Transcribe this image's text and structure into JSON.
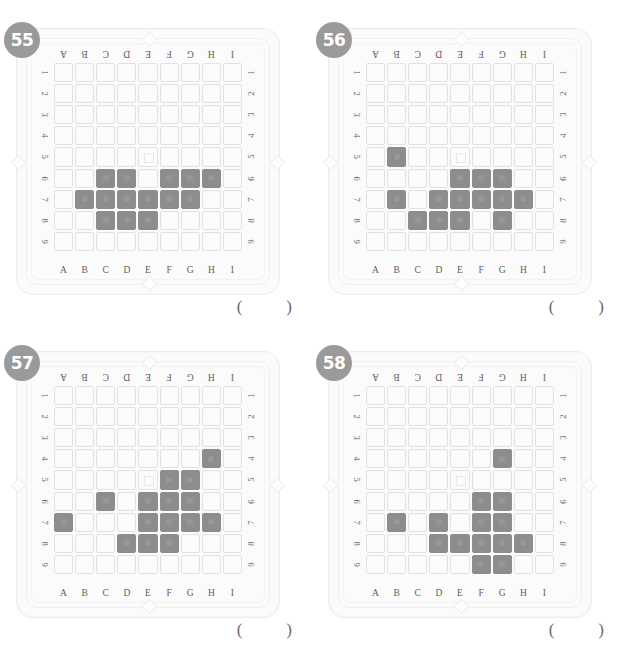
{
  "page": {
    "column_labels": [
      "A",
      "B",
      "C",
      "D",
      "E",
      "F",
      "G",
      "H",
      "I"
    ],
    "row_labels": [
      "1",
      "2",
      "3",
      "4",
      "5",
      "6",
      "7",
      "8",
      "9"
    ],
    "answer_open": "(",
    "answer_close": ")",
    "colors": {
      "badge_background": "#9a9a9a",
      "badge_text": "#ffffff",
      "well_empty": "#fcfcfc",
      "well_filled": "#8d8d8d",
      "well_border": "#e2e2e2",
      "plate_background": "#fbfbfb",
      "label_text": "#5d5d5d",
      "page_background": "#ffffff"
    },
    "mark_cell": "E5"
  },
  "panels": [
    {
      "number": "55",
      "grid_rows": 9,
      "grid_cols": 9,
      "filled_cells": [
        "C6",
        "D6",
        "F6",
        "G6",
        "H6",
        "B7",
        "C7",
        "D7",
        "E7",
        "F7",
        "G7",
        "C8",
        "D8",
        "E8"
      ],
      "filled_by_row": {
        "1": [],
        "2": [],
        "3": [],
        "4": [],
        "5": [],
        "6": [
          "C",
          "D",
          "F",
          "G",
          "H"
        ],
        "7": [
          "B",
          "C",
          "D",
          "E",
          "F",
          "G"
        ],
        "8": [
          "C",
          "D",
          "E"
        ],
        "9": []
      },
      "filled_count": 14
    },
    {
      "number": "56",
      "grid_rows": 9,
      "grid_cols": 9,
      "filled_cells": [
        "B5",
        "E6",
        "F6",
        "G6",
        "B7",
        "D7",
        "E7",
        "F7",
        "G7",
        "H7",
        "C8",
        "D8",
        "E8",
        "G8"
      ],
      "filled_by_row": {
        "1": [],
        "2": [],
        "3": [],
        "4": [],
        "5": [
          "B"
        ],
        "6": [
          "E",
          "F",
          "G"
        ],
        "7": [
          "B",
          "D",
          "E",
          "F",
          "G",
          "H"
        ],
        "8": [
          "C",
          "D",
          "E",
          "G"
        ],
        "9": []
      },
      "filled_count": 14
    },
    {
      "number": "57",
      "grid_rows": 9,
      "grid_cols": 9,
      "filled_cells": [
        "H4",
        "F5",
        "G5",
        "C6",
        "E6",
        "F6",
        "G6",
        "A7",
        "E7",
        "F7",
        "G7",
        "H7",
        "D8",
        "E8",
        "F8"
      ],
      "filled_by_row": {
        "1": [],
        "2": [],
        "3": [],
        "4": [
          "H"
        ],
        "5": [
          "F",
          "G"
        ],
        "6": [
          "C",
          "E",
          "F",
          "G"
        ],
        "7": [
          "A",
          "E",
          "F",
          "G",
          "H"
        ],
        "8": [
          "D",
          "E",
          "F"
        ],
        "9": []
      },
      "filled_count": 15
    },
    {
      "number": "58",
      "grid_rows": 9,
      "grid_cols": 9,
      "filled_cells": [
        "G4",
        "F6",
        "G6",
        "B7",
        "D7",
        "F7",
        "G7",
        "D8",
        "E8",
        "F8",
        "G8",
        "H8",
        "F9",
        "G9"
      ],
      "filled_by_row": {
        "1": [],
        "2": [],
        "3": [],
        "4": [
          "G"
        ],
        "5": [],
        "6": [
          "F",
          "G"
        ],
        "7": [
          "B",
          "D",
          "F",
          "G"
        ],
        "8": [
          "D",
          "E",
          "F",
          "G",
          "H"
        ],
        "9": [
          "F",
          "G"
        ]
      },
      "filled_count": 14
    }
  ]
}
